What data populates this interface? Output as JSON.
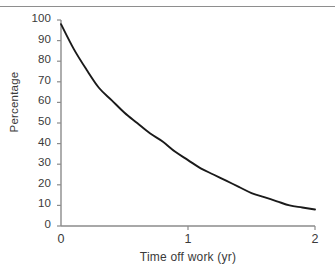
{
  "chart_data": {
    "type": "line",
    "title": "",
    "xlabel": "Time off work (yr)",
    "ylabel": "Percentage",
    "xlim": [
      0,
      2
    ],
    "ylim": [
      0,
      100
    ],
    "xticks": [
      0,
      1,
      2
    ],
    "xtick_labels": [
      "0",
      "1",
      "2"
    ],
    "yticks": [
      0,
      10,
      20,
      30,
      40,
      50,
      60,
      70,
      80,
      90,
      100
    ],
    "ytick_labels": [
      "0",
      "10",
      "20",
      "30",
      "40",
      "50",
      "60",
      "70",
      "80",
      "90",
      "100"
    ],
    "grid": false,
    "legend": null,
    "series": [
      {
        "name": "Percentage off work",
        "color": "#1a1a1a",
        "x": [
          0.0,
          0.1,
          0.2,
          0.3,
          0.4,
          0.5,
          0.6,
          0.7,
          0.8,
          0.9,
          1.0,
          1.1,
          1.2,
          1.3,
          1.4,
          1.5,
          1.6,
          1.7,
          1.8,
          1.9,
          2.0
        ],
        "values": [
          98,
          86,
          76,
          67,
          61,
          55,
          50,
          45,
          41,
          36,
          32,
          28,
          25,
          22,
          19,
          16,
          14,
          12,
          10,
          9,
          8
        ]
      }
    ]
  },
  "axes": {
    "axis_color": "#8b8b8b",
    "tick_color": "#8b8b8b",
    "curve_color": "#1a1a1a"
  }
}
